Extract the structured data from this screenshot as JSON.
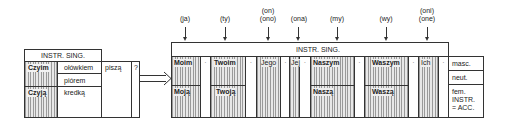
{
  "left_table": {
    "header": "INSTR. SING.",
    "rows": [
      {
        "question": "Czyim",
        "noun": "ołówkiem"
      },
      {
        "question": "",
        "noun": "piórem"
      },
      {
        "question": "Czyją",
        "noun": "kredką"
      }
    ],
    "verb": "piszą",
    "punct": "?"
  },
  "right_table": {
    "header": "INSTR. SING.",
    "pronouns": [
      {
        "label": "(ja)",
        "masc_neut": "Moim",
        "fem": "Moją"
      },
      {
        "label": "(ty)",
        "masc_neut": "Twoim",
        "fem": "Twoją"
      },
      {
        "label1": "(on)",
        "label2": "(ono)",
        "all": "Jego"
      },
      {
        "label": "(ona)",
        "all": "Jej"
      },
      {
        "label": "(my)",
        "masc_neut": "Naszym",
        "fem": "Naszą"
      },
      {
        "label": "(wy)",
        "masc_neut": "Waszym",
        "fem": "Waszą"
      },
      {
        "label1": "(oni)",
        "label2": "(one)",
        "all": "Ich"
      }
    ],
    "separator": "·",
    "legend": {
      "masc": "masc.",
      "neut": "neut.",
      "fem_line1": "fem.",
      "fem_line2": "INSTR.",
      "fem_line3": "= ACC."
    }
  }
}
